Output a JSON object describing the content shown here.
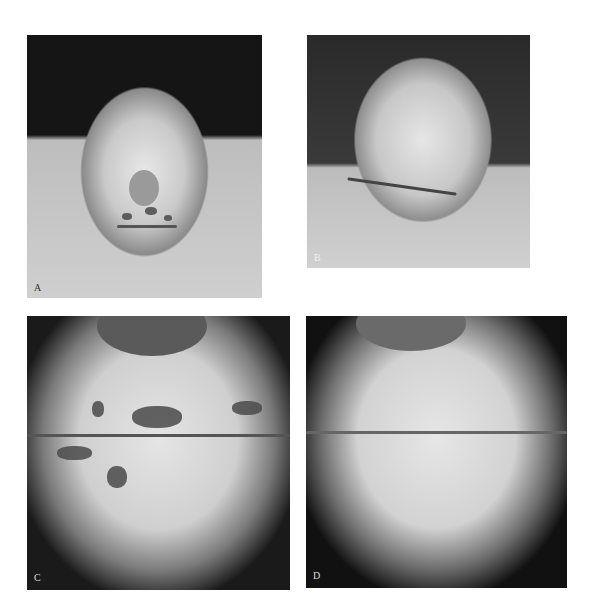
{
  "figure": {
    "panels": [
      {
        "id": "A",
        "label": "A",
        "description": "Frontal view of face with perioral lesions"
      },
      {
        "id": "B",
        "label": "B",
        "description": "Posterior scalp with sutured incision"
      },
      {
        "id": "C",
        "label": "C",
        "description": "Close-up of lips with dark lesions"
      },
      {
        "id": "D",
        "label": "D",
        "description": "Close-up of lips after resolution"
      }
    ]
  }
}
